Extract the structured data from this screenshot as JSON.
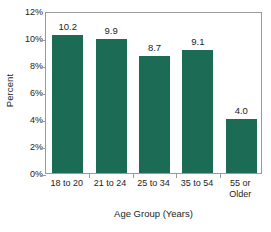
{
  "chart_data": {
    "type": "bar",
    "title": "",
    "subtitle": "",
    "xlabel": "Age Group (Years)",
    "ylabel": "Percent",
    "categories": [
      "18 to 20",
      "21 to 24",
      "25 to 34",
      "35 to 54",
      "55 or Older"
    ],
    "category_lines": [
      [
        "18 to 20"
      ],
      [
        "21 to 24"
      ],
      [
        "25 to 34"
      ],
      [
        "35 to 54"
      ],
      [
        "55 or",
        "Older"
      ]
    ],
    "values": [
      10.2,
      9.9,
      8.7,
      9.1,
      4.0
    ],
    "value_labels": [
      "10.2",
      "9.9",
      "8.7",
      "9.1",
      "4.0"
    ],
    "ylim": [
      0,
      12
    ],
    "yticks": [
      0,
      2,
      4,
      6,
      8,
      10,
      12
    ],
    "ytick_labels": [
      "0%",
      "2%",
      "4%",
      "6%",
      "8%",
      "10%",
      "12%"
    ],
    "grid": false,
    "legend": null,
    "legend_position": "none",
    "bar_color": "#1b6b55",
    "axis_color": "#9a9a9a",
    "text_color": "#1c1c1c",
    "background": "#ffffff"
  }
}
